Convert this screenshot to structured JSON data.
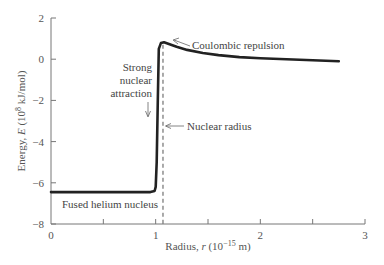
{
  "chart_data": {
    "type": "line",
    "title": "",
    "xlabel": "Radius, r (10^-15 m)",
    "ylabel": "Energy, E (10^8 kJ/mol)",
    "xlabel_parts": {
      "pre": "Radius, ",
      "var": "r",
      "mid": " (10",
      "exp": "−15",
      "post": " m)"
    },
    "ylabel_parts": {
      "pre": "Energy, ",
      "var": "E",
      "mid": " (10",
      "exp": "8",
      "post": " kJ/mol)"
    },
    "xlim": [
      0,
      3
    ],
    "ylim": [
      -8,
      2
    ],
    "x_ticks": [
      0,
      1,
      2,
      3
    ],
    "x_minor_ticks": [
      0.5,
      1.5,
      2.5
    ],
    "y_ticks": [
      2,
      0,
      -2,
      -4,
      -6,
      -8
    ],
    "x_tick_labels": [
      "0",
      "1",
      "2",
      "3"
    ],
    "y_tick_labels": [
      "2",
      "0",
      "−2",
      "−4",
      "−6",
      "−8"
    ],
    "grid": false,
    "legend": null,
    "series": [
      {
        "name": "Potential energy",
        "color": "#222222",
        "x": [
          0.0,
          0.5,
          0.95,
          0.99,
          1.0,
          1.01,
          1.02,
          1.03,
          1.05,
          1.08,
          1.12,
          1.2,
          1.3,
          1.45,
          1.6,
          1.8,
          2.0,
          2.25,
          2.5,
          2.75
        ],
        "y": [
          -6.45,
          -6.45,
          -6.45,
          -6.4,
          -6.2,
          -5.0,
          -2.0,
          0.5,
          0.78,
          0.82,
          0.75,
          0.6,
          0.45,
          0.3,
          0.2,
          0.1,
          0.05,
          0.0,
          -0.05,
          -0.1
        ]
      }
    ],
    "reference_lines": [
      {
        "type": "vertical",
        "x": 1.07,
        "style": "dashed",
        "label": "Nuclear radius"
      }
    ],
    "annotations": [
      {
        "text": "Coulombic repulsion",
        "points_to": [
          1.1,
          0.82
        ]
      },
      {
        "text": "Strong nuclear attraction",
        "lines": [
          "Strong",
          "nuclear",
          "attraction"
        ],
        "points_to": [
          1.0,
          -3.0
        ]
      },
      {
        "text": "Nuclear radius",
        "points_to": [
          1.07,
          -3.4
        ]
      },
      {
        "text": "Fused helium nucleus",
        "at": [
          0.25,
          -6.9
        ]
      }
    ]
  }
}
